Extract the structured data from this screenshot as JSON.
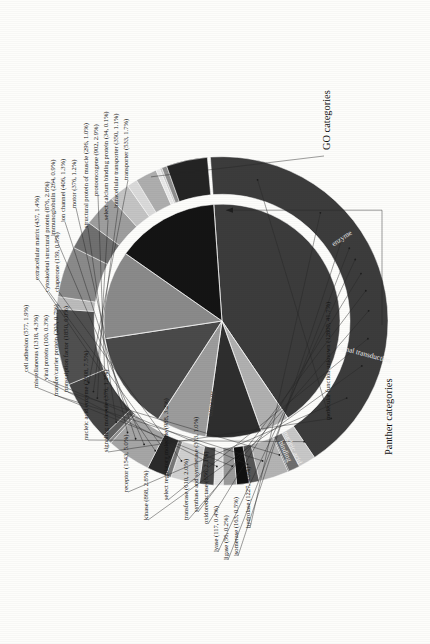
{
  "figure": {
    "annotation_outer": "GO categories",
    "annotation_inner": "Panther categories"
  },
  "inner_ring_labels": [
    {
      "text": "nucleic acid\nbinding"
    },
    {
      "text": "signal transduction"
    },
    {
      "text": "enzyme"
    }
  ],
  "chart_data": {
    "type": "pie",
    "title": "",
    "subtitle": "",
    "xlabel": "",
    "ylabel": "",
    "grid": false,
    "legend_position": "leader-labels",
    "rings": [
      {
        "name": "GO categories",
        "position": "outer",
        "annotation": "GO categories",
        "total": 30741,
        "slices": [
          {
            "label": "molecular function unknown",
            "count": 12809,
            "percent": 41.7,
            "color": "#3c3c3c"
          },
          {
            "label": "transporter",
            "count": 533,
            "percent": 1.7,
            "color": "#c8c8c8"
          },
          {
            "label": "intracellular transporter",
            "count": 350,
            "percent": 1.1,
            "color": "#6e6e6e"
          },
          {
            "label": "select calcium binding protein",
            "count": 34,
            "percent": 0.1,
            "color": "#1c1c1c"
          },
          {
            "label": "protooncogene",
            "count": 902,
            "percent": 2.9,
            "color": "#b4b4b4"
          },
          {
            "label": "structural protein of muscle",
            "count": 296,
            "percent": 1.0,
            "color": "#565656"
          },
          {
            "label": "motor",
            "count": 376,
            "percent": 1.2,
            "color": "#101010"
          },
          {
            "label": "ion channel",
            "count": 406,
            "percent": 1.3,
            "color": "#9a9a9a"
          },
          {
            "label": "immunoglobulin",
            "count": 264,
            "percent": 0.9,
            "color": "#e2e2e2"
          },
          {
            "label": "extracellular matrix",
            "count": 437,
            "percent": 1.4,
            "color": "#484848"
          },
          {
            "label": "cytoskeletal structural protein",
            "count": 876,
            "percent": 2.8,
            "color": "#d0d0d0"
          },
          {
            "label": "chaperone",
            "count": 159,
            "percent": 0.5,
            "color": "#787878"
          },
          {
            "label": "cell adhesion",
            "count": 577,
            "percent": 1.9,
            "color": "#2a2a2a"
          },
          {
            "label": "miscellaneous",
            "count": 1318,
            "percent": 4.3,
            "color": "#a6a6a6"
          },
          {
            "label": "viral protein",
            "count": 100,
            "percent": 0.3,
            "color": "#8c8c8c"
          },
          {
            "label": "transfer/carrier protein",
            "count": 203,
            "percent": 0.7,
            "color": "#606060"
          },
          {
            "label": "transcription factor",
            "count": 1850,
            "percent": 6.0,
            "color": "#454545"
          },
          {
            "label": "nucleic acid enzyme",
            "count": 2308,
            "percent": 7.5,
            "color": "#505050"
          },
          {
            "label": "signaling molecule",
            "count": 376,
            "percent": 1.2,
            "color": "#bcbcbc"
          },
          {
            "label": "receptor",
            "count": 1543,
            "percent": 5.0,
            "color": "#8a8a8a"
          },
          {
            "label": "kinase",
            "count": 868,
            "percent": 2.8,
            "color": "#707070"
          },
          {
            "label": "select regulatory molecule",
            "count": 988,
            "percent": 3.2,
            "color": "#9e9e9e"
          },
          {
            "label": "transferase",
            "count": 610,
            "percent": 2.0,
            "color": "#c4c4c4"
          },
          {
            "label": "synthase and synthetase",
            "count": 313,
            "percent": 1.0,
            "color": "#dadada"
          },
          {
            "label": "oxidoreductase",
            "count": 656,
            "percent": 2.1,
            "color": "#aeaeae"
          },
          {
            "label": "lyase",
            "count": 117,
            "percent": 0.4,
            "color": "#e8e8e8"
          },
          {
            "label": "ligase",
            "count": 56,
            "percent": 0.2,
            "color": "#cccccc"
          },
          {
            "label": "isomerase",
            "count": 163,
            "percent": 0.5,
            "color": "#8e8e8e"
          },
          {
            "label": "hydrolase",
            "count": 1227,
            "percent": 4.0,
            "color": "#242424"
          }
        ]
      },
      {
        "name": "Panther categories",
        "position": "inner",
        "annotation": "Panther categories",
        "visible_slice_labels": [
          "nucleic acid binding",
          "signal transduction",
          "enzyme"
        ],
        "slices": [
          {
            "label": "molecular function unknown",
            "percent": 41.7,
            "color": "#3c3c3c"
          },
          {
            "label": "transporter group",
            "percent": 4.0,
            "color": "#b0b0b0"
          },
          {
            "label": "structural / motor group",
            "percent": 7.6,
            "color": "#2e2e2e"
          },
          {
            "label": "defense / adhesion group",
            "percent": 6.9,
            "color": "#9c9c9c"
          },
          {
            "label": "nucleic acid binding",
            "percent": 13.5,
            "color": "#4a4a4a"
          },
          {
            "label": "signal transduction",
            "percent": 12.2,
            "color": "#8a8a8a"
          },
          {
            "label": "enzyme",
            "percent": 14.1,
            "color": "#141414"
          }
        ]
      }
    ]
  },
  "leader_labels": [
    {
      "id": "chaperone",
      "text": "chaperone (159, 0.5%)"
    },
    {
      "id": "cytoskeletal-structural",
      "text": "cytoskeletal structural protein (876, 2.8%)"
    },
    {
      "id": "extracellular-matrix",
      "text": "extracellular matrix (437, 1.4%)"
    },
    {
      "id": "immunoglobulin",
      "text": "immunoglobulin (264, 0.9%)"
    },
    {
      "id": "ion-channel",
      "text": "ion channel (406, 1.3%)"
    },
    {
      "id": "motor",
      "text": "motor (376, 1.2%)"
    },
    {
      "id": "structural-protein-muscle",
      "text": "structural protein of muscle (296, 1.0%)"
    },
    {
      "id": "protooncogene",
      "text": "protooncogene (902, 2.9%)"
    },
    {
      "id": "select-calcium-binding",
      "text": "select calcium binding protein (34, 0.1%)"
    },
    {
      "id": "intracellular-transporter",
      "text": "intracellular transporter (350, 1.1%)"
    },
    {
      "id": "transporter",
      "text": "transporter (533, 1.7%)"
    },
    {
      "id": "cell-adhesion",
      "text": "cell adhesion (577, 1.9%)"
    },
    {
      "id": "miscellaneous",
      "text": "miscellaneous (1318, 4.3%)"
    },
    {
      "id": "viral-protein",
      "text": "viral protein (100, 0.3%)"
    },
    {
      "id": "transfer-carrier-protein",
      "text": "transfer/carrier protein (203, 0.7%)"
    },
    {
      "id": "transcription-factor",
      "text": "transcription factor (1850, 6.0%)"
    },
    {
      "id": "nucleic-acid-enzyme",
      "text": "nucleic acid enzyme (2308, 7.5%)"
    },
    {
      "id": "signaling-molecule",
      "text": "signaling molecule (376, 1.2%)"
    },
    {
      "id": "receptor",
      "text": "receptor (1543, 5.0%)"
    },
    {
      "id": "kinase",
      "text": "kinase (868, 2.8%)"
    },
    {
      "id": "select-regulatory-molecule",
      "text": "select regulatory molecule (988, 3.2%)"
    },
    {
      "id": "transferase",
      "text": "transferase (610, 2.0%)"
    },
    {
      "id": "synthase-synthetase",
      "text": "synthase and synthetase (313, 1.0%)"
    },
    {
      "id": "oxidoreductase",
      "text": "oxidoreductase (656, 2.1%)"
    },
    {
      "id": "lyase",
      "text": "lyase (117, 0.4%)"
    },
    {
      "id": "ligase",
      "text": "ligase (56, 0.2%)"
    },
    {
      "id": "isomerase",
      "text": "isomerase (163, 0.5%)"
    },
    {
      "id": "hydrolase",
      "text": "hydrolase (1227, 4.0%)"
    },
    {
      "id": "molecular-function-unknown",
      "text": "molecular function unknown (12809, 41.7%)"
    }
  ]
}
